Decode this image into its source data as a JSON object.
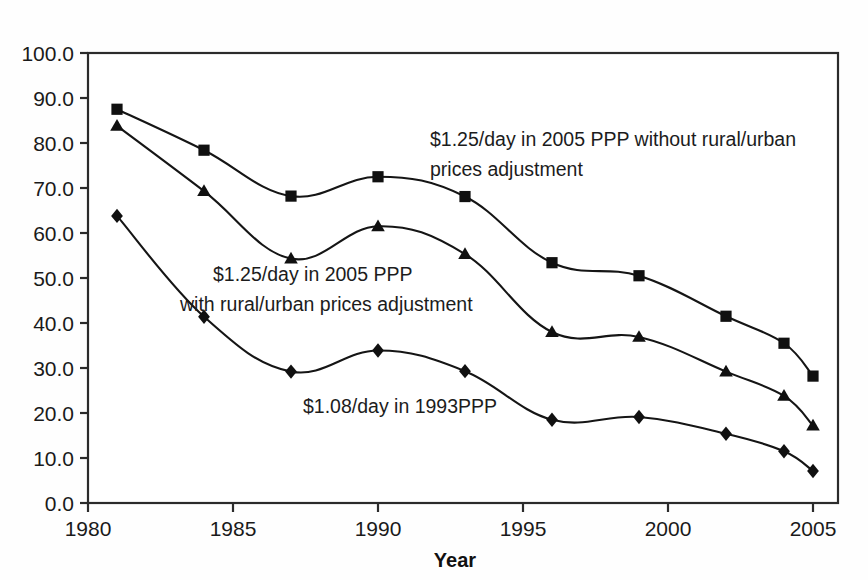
{
  "chart_data": {
    "type": "line",
    "title": "",
    "xlabel": "Year",
    "ylabel": "",
    "xlim": [
      1980,
      2005.9
    ],
    "ylim": [
      0,
      100
    ],
    "grid": false,
    "legend_position": "inline-annotations",
    "x": [
      1981,
      1984,
      1987,
      1990,
      1993,
      1996,
      1999,
      2002,
      2004,
      2005
    ],
    "xticks": [
      "1980",
      "1985",
      "1990",
      "1995",
      "2000",
      "2005"
    ],
    "xtick_values": [
      1980,
      1985,
      1990,
      1995,
      2000,
      2005
    ],
    "yticks": [
      "0.0",
      "10.0",
      "20.0",
      "30.0",
      "40.0",
      "50.0",
      "60.0",
      "70.0",
      "80.0",
      "90.0",
      "100.0"
    ],
    "ytick_values": [
      0,
      10,
      20,
      30,
      40,
      50,
      60,
      70,
      80,
      90,
      100
    ],
    "series": [
      {
        "name": "$1.25/day in 2005 PPP without rural/urban prices adjustment",
        "marker": "square",
        "values": [
          87.5,
          78.4,
          68.2,
          72.5,
          68.1,
          53.4,
          50.5,
          41.5,
          35.5,
          28.2
        ]
      },
      {
        "name": "$1.25/day in 2005 PPP with rural/urban prices adjustment",
        "marker": "triangle",
        "values": [
          83.8,
          69.3,
          54.3,
          61.5,
          55.3,
          38.0,
          36.9,
          29.2,
          23.8,
          17.2
        ]
      },
      {
        "name": "$1.08/day in 1993PPP",
        "marker": "diamond",
        "values": [
          63.8,
          41.4,
          29.2,
          33.9,
          29.3,
          18.5,
          19.1,
          15.4,
          11.5,
          7.1
        ]
      }
    ],
    "annotations": [
      {
        "id": "annotation-without-adjustment",
        "lines": [
          "$1.25/day in 2005 PPP without rural/urban",
          "prices adjustment"
        ],
        "x": 430,
        "y": 146
      },
      {
        "id": "annotation-with-adjustment",
        "lines": [
          "$1.25/day in 2005 PPP",
          "with rural/urban prices adjustment"
        ],
        "x": 213,
        "y": 281
      },
      {
        "id": "annotation-1993ppp",
        "lines": [
          "$1.08/day in 1993PPP"
        ],
        "x": 303,
        "y": 413
      }
    ],
    "colors": {
      "line": "#151515",
      "marker": "#101010",
      "axis": "#2b2b2b",
      "text": "#1a1a1a",
      "background": "#ffffff"
    }
  }
}
